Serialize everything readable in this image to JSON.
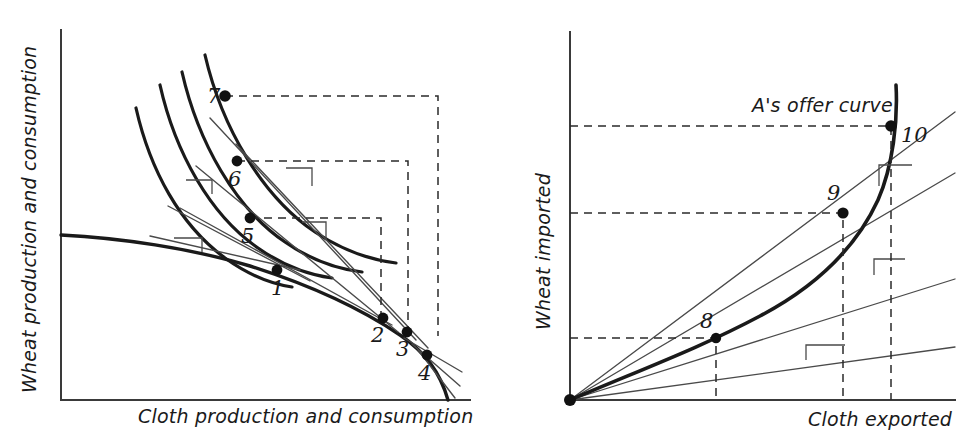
{
  "figure": {
    "type": "diagram",
    "background_color": "#ffffff",
    "ink_color": "#1a1a1a"
  },
  "left_panel": {
    "name": "production-consumption-panel",
    "x_axis_label": "Cloth production and consumption",
    "y_axis_label": "Wheat production and consumption",
    "axis": {
      "x_origin": 61,
      "y_origin": 400,
      "x_end": 470,
      "y_top": 30
    },
    "ppf": {
      "name": "production-possibility-frontier",
      "description": "concave transformation curve from wheat intercept down to cloth intercept"
    },
    "indifference_curves": [
      {
        "id": "ic-1",
        "label": "lowest"
      },
      {
        "id": "ic-2",
        "label": "second"
      },
      {
        "id": "ic-3",
        "label": "third"
      },
      {
        "id": "ic-4",
        "label": "highest"
      }
    ],
    "points": [
      {
        "id": "1",
        "label": "1",
        "kind": "production-point",
        "x": 277,
        "y": 270,
        "label_x": 271,
        "label_y": 295
      },
      {
        "id": "2",
        "label": "2",
        "kind": "production-point",
        "x": 383,
        "y": 318,
        "label_x": 371,
        "label_y": 342
      },
      {
        "id": "3",
        "label": "3",
        "kind": "production-point",
        "x": 407,
        "y": 332,
        "label_x": 396,
        "label_y": 356
      },
      {
        "id": "4",
        "label": "4",
        "kind": "production-point",
        "x": 427,
        "y": 355,
        "label_x": 418,
        "label_y": 380
      },
      {
        "id": "5",
        "label": "5",
        "kind": "consumption-point",
        "x": 250,
        "y": 218,
        "label_x": 241,
        "label_y": 243
      },
      {
        "id": "6",
        "label": "6",
        "kind": "consumption-point",
        "x": 237,
        "y": 161,
        "label_x": 228,
        "label_y": 186
      },
      {
        "id": "7",
        "label": "7",
        "kind": "consumption-point",
        "x": 225,
        "y": 96,
        "label_x": 208,
        "label_y": 104
      }
    ],
    "slope_markers": 4
  },
  "right_panel": {
    "name": "offer-curve-panel",
    "x_axis_label": "Cloth exported",
    "y_axis_label": "Wheat imported",
    "curve_label": "A's offer curve",
    "curve_label_x": 752,
    "curve_label_y": 108,
    "axis": {
      "x_origin": 570,
      "y_origin": 400,
      "x_end": 955,
      "y_top": 32
    },
    "points": [
      {
        "id": "8",
        "label": "8",
        "kind": "trade-point",
        "x": 716,
        "y": 340,
        "label_x": 700,
        "label_y": 326
      },
      {
        "id": "9",
        "label": "9",
        "kind": "trade-point",
        "x": 843,
        "y": 213,
        "label_x": 827,
        "label_y": 198
      },
      {
        "id": "10",
        "label": "10",
        "kind": "trade-point",
        "x": 891,
        "y": 126,
        "label_x": 903,
        "label_y": 139
      },
      {
        "id": "origin",
        "label": "",
        "kind": "origin-point",
        "x": 570,
        "y": 400,
        "label_x": 0,
        "label_y": 0
      }
    ],
    "rays": 4,
    "slope_markers": 3
  }
}
